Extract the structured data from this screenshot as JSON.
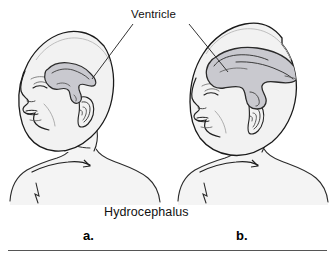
{
  "figure": {
    "type": "medical-illustration",
    "caption": "Hydrocephalus",
    "annotation_label": "Ventricle",
    "panels": [
      {
        "id": "a",
        "label": "a.",
        "description": "Infant head in left-facing profile with normal-sized lateral ventricle",
        "head_size": "normal"
      },
      {
        "id": "b",
        "label": "b.",
        "description": "Infant head in left-facing profile with greatly enlarged lateral ventricle and enlarged cranium",
        "head_size": "enlarged"
      }
    ],
    "colors": {
      "outline": "#1a1a1a",
      "head_fill": "#f2f2f2",
      "ventricle_fill": "#c9c9cf",
      "ventricle_outline": "#2a2a2a",
      "body_fill": "#f4f4f4",
      "leader_line": "#333333",
      "divider_rule": "#555555",
      "background": "#ffffff",
      "text": "#111111"
    },
    "divider_rule": {
      "present": true,
      "position": "bottom"
    },
    "leader_lines": [
      {
        "from": "Ventricle label",
        "to": "panel a ventricle"
      },
      {
        "from": "Ventricle label",
        "to": "panel b ventricle"
      }
    ]
  }
}
